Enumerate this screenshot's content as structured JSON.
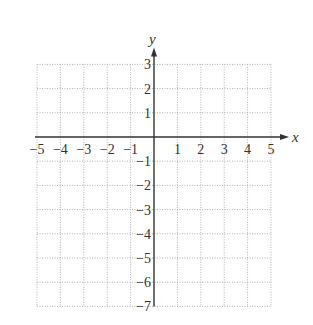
{
  "chart_data": {
    "type": "scatter",
    "title": "",
    "xlabel": "x",
    "ylabel": "y",
    "xlim": [
      -5,
      5
    ],
    "ylim": [
      -7,
      3
    ],
    "grid": true,
    "grid_style": "dotted",
    "x_ticks": [
      -5,
      -4,
      -3,
      -2,
      -1,
      1,
      2,
      3,
      4,
      5
    ],
    "y_ticks": [
      3,
      2,
      1,
      -1,
      -2,
      -3,
      -4,
      -5,
      -6,
      -7
    ],
    "x_tick_labels": [
      "−5",
      "−4",
      "−3",
      "−2",
      "−1",
      "1",
      "2",
      "3",
      "4",
      "5"
    ],
    "y_tick_labels": [
      "3",
      "2",
      "1",
      "−1",
      "−2",
      "−3",
      "−4",
      "−5",
      "−6",
      "−7"
    ],
    "series": [],
    "legend": null
  },
  "colors": {
    "axis": "#333333",
    "grid": "#b0b0b0",
    "text": "#333333"
  }
}
